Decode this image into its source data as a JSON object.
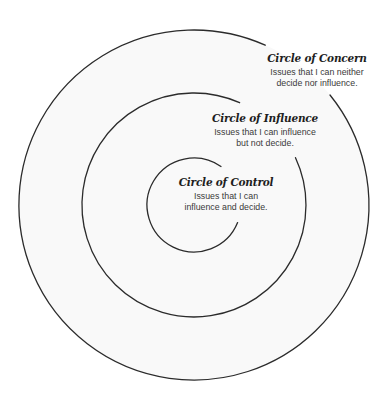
{
  "diagram": {
    "stroke_color": "#2b2b2b",
    "background": "#f9f9f9",
    "circles": [
      {
        "id": "concern",
        "title": "Circle of Concern",
        "desc_line1": "Issues that I can neither",
        "desc_line2": "decide nor influence."
      },
      {
        "id": "influence",
        "title": "Circle of Influence",
        "desc_line1": "Issues that I can influence",
        "desc_line2": "but not decide."
      },
      {
        "id": "control",
        "title": "Circle of Control",
        "desc_line1": "Issues that I can",
        "desc_line2": "influence and decide."
      }
    ]
  }
}
